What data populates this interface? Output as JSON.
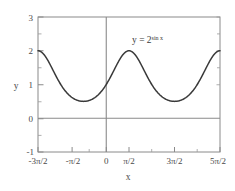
{
  "chart_data": {
    "type": "line",
    "title": "",
    "xlabel": "x",
    "ylabel": "y",
    "xlim": [
      -4.71238898,
      7.85398163
    ],
    "ylim": [
      -1,
      3
    ],
    "grid": false,
    "legend": null,
    "annotations": [
      {
        "name": "curve-equation",
        "text_base": "y = 2",
        "text_sup": "sin x",
        "full_text": "y = 2^(sin x)",
        "x": 2.6,
        "y": 2.55
      }
    ],
    "xticks": [
      {
        "value": -4.71238898,
        "label": "-3π/2"
      },
      {
        "value": -1.57079633,
        "label": "-π/2"
      },
      {
        "value": 0,
        "label": "0"
      },
      {
        "value": 1.57079633,
        "label": "π/2"
      },
      {
        "value": 4.71238898,
        "label": "3π/2"
      },
      {
        "value": 7.85398163,
        "label": "5π/2"
      }
    ],
    "xticks_minor": [
      -3.14159265,
      3.14159265,
      6.28318531
    ],
    "yticks": [
      {
        "value": 3,
        "label": "3"
      },
      {
        "value": 2,
        "label": "2"
      },
      {
        "value": 1,
        "label": "1"
      },
      {
        "value": 0,
        "label": "0"
      },
      {
        "value": -1,
        "label": "-1"
      }
    ],
    "yticks_minor": [
      2.5,
      1.5,
      0.5,
      -0.5
    ],
    "series": [
      {
        "name": "y = 2^(sin x)",
        "function": "2**sin(x)",
        "color": "#3a3a3a",
        "key_points": [
          {
            "x": -4.71238898,
            "y": 2.0
          },
          {
            "x": -3.14159265,
            "y": 1.0
          },
          {
            "x": -1.57079633,
            "y": 0.5
          },
          {
            "x": 0,
            "y": 1.0
          },
          {
            "x": 1.57079633,
            "y": 2.0
          },
          {
            "x": 3.14159265,
            "y": 1.0
          },
          {
            "x": 4.71238898,
            "y": 0.5
          },
          {
            "x": 6.28318531,
            "y": 1.0
          },
          {
            "x": 7.85398163,
            "y": 2.0
          }
        ]
      }
    ],
    "reference_lines": [
      {
        "name": "y-zero-line",
        "orientation": "horizontal",
        "value": 0,
        "color": "#8a8a8a"
      },
      {
        "name": "x-zero-line",
        "orientation": "vertical",
        "value": 0,
        "color": "#8a8a8a"
      }
    ]
  },
  "labels": {
    "y_axis": "y",
    "x_axis": "x",
    "ytick_3": "3",
    "ytick_2": "2",
    "ytick_1": "1",
    "ytick_0": "0",
    "ytick_m1": "-1",
    "xtick_m3pi2": "-3π/2",
    "xtick_mpi2": "-π/2",
    "xtick_0": "0",
    "xtick_pi2": "π/2",
    "xtick_3pi2": "3π/2",
    "xtick_5pi2": "5π/2",
    "equation_base": "y = 2",
    "equation_exponent": "sin x"
  }
}
